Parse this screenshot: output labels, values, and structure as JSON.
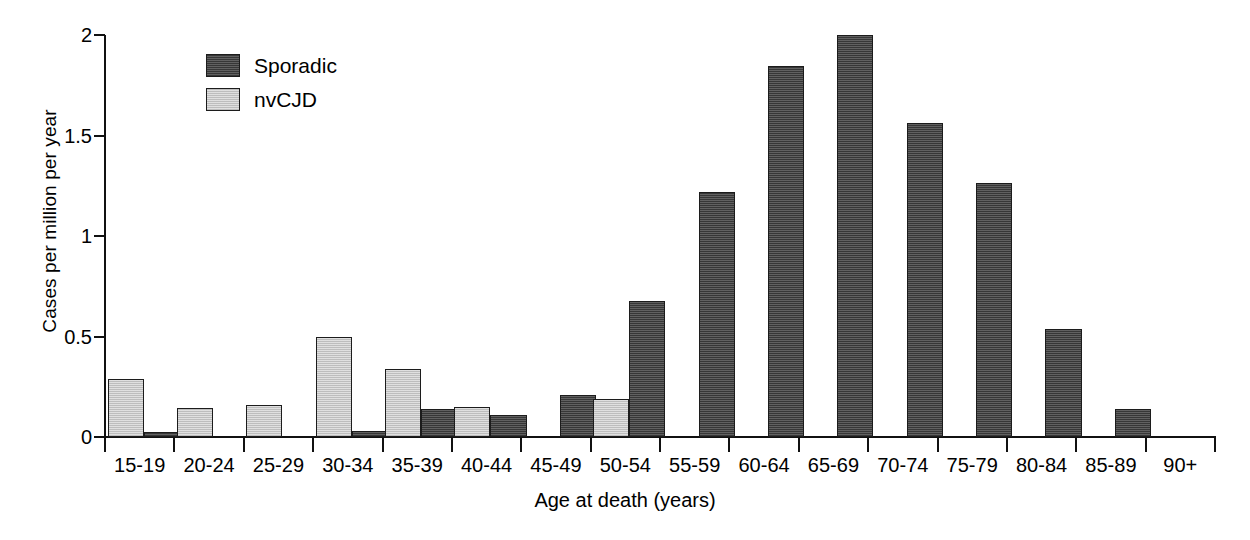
{
  "chart_data": {
    "type": "bar",
    "title": "",
    "xlabel": "Age at death (years)",
    "ylabel": "Cases per million per year",
    "categories": [
      "15-19",
      "20-24",
      "25-29",
      "30-34",
      "35-39",
      "40-44",
      "45-49",
      "50-54",
      "55-59",
      "60-64",
      "65-69",
      "70-74",
      "75-79",
      "80-84",
      "85-89",
      "90+"
    ],
    "series": [
      {
        "name": "nvCJD",
        "color": "#d2d2d2",
        "values": [
          0.29,
          0.145,
          0.16,
          0.5,
          0.34,
          0.15,
          0.0,
          0.19,
          0.0,
          0.0,
          0.0,
          0.0,
          0.0,
          0.0,
          0.0,
          0.0
        ]
      },
      {
        "name": "Sporadic",
        "color": "#4f4f4f",
        "values": [
          0.025,
          0.0,
          0.0,
          0.03,
          0.14,
          0.11,
          0.21,
          0.675,
          1.22,
          1.845,
          2.0,
          1.56,
          1.265,
          0.535,
          0.14,
          0.0
        ]
      }
    ],
    "series_order_in_group": [
      "nvCJD",
      "Sporadic"
    ],
    "ylim": [
      0,
      2
    ],
    "yticks": [
      0,
      0.5,
      1,
      1.5,
      2
    ],
    "ytick_labels": [
      "0",
      "0.5",
      "1",
      "1.5",
      "2"
    ],
    "grid": false,
    "legend_position": "top-left-inside"
  },
  "legend": {
    "entries": [
      {
        "label": "Sporadic",
        "swatch": "sporadic"
      },
      {
        "label": "nvCJD",
        "swatch": "nvcjd"
      }
    ]
  },
  "axes": {
    "y_title": "Cases per million per year",
    "x_title": "Age at death (years)"
  }
}
